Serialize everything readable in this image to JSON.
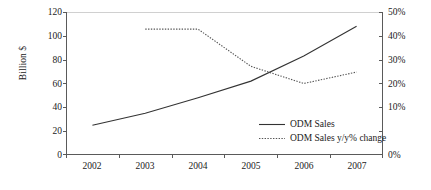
{
  "chart_data": {
    "type": "line",
    "title": "",
    "xlabel": "",
    "categories": [
      "2002",
      "2003",
      "2004",
      "2005",
      "2006",
      "2007"
    ],
    "grid": false,
    "legend_position": "inside-bottom-right",
    "axes": {
      "left": {
        "label": "Billion $",
        "ticks": [
          "0",
          "20",
          "40",
          "60",
          "80",
          "100",
          "120"
        ],
        "values": [
          0,
          20,
          40,
          60,
          80,
          100,
          120
        ],
        "ylim": [
          0,
          120
        ]
      },
      "right": {
        "label": "",
        "ticks": [
          "0%",
          "10%",
          "20%",
          "30%",
          "40%",
          "50%"
        ],
        "values": [
          0,
          10,
          20,
          30,
          40,
          50
        ],
        "ylim": [
          0,
          50
        ]
      }
    },
    "series": [
      {
        "name": "ODM Sales",
        "axis": "left",
        "style": "solid",
        "color": "#333333",
        "values": [
          25,
          35,
          48,
          62,
          83,
          108
        ]
      },
      {
        "name": "ODM Sales y/y% change",
        "axis": "right",
        "style": "dotted",
        "color": "#555555",
        "values": [
          null,
          44,
          44,
          31,
          25,
          29
        ]
      }
    ]
  },
  "legend": {
    "items": [
      {
        "label": "ODM Sales"
      },
      {
        "label": "ODM Sales y/y% change"
      }
    ]
  },
  "axis_titles": {
    "left": "Billion $"
  },
  "y_left_labels": [
    "120",
    "100",
    "80",
    "60",
    "40",
    "20",
    "0"
  ],
  "y_right_labels": [
    "50%",
    "40%",
    "30%",
    "20%",
    "10%",
    "0%"
  ],
  "x_labels": [
    "2002",
    "2003",
    "2004",
    "2005",
    "2006",
    "2007"
  ],
  "colors": {
    "axis": "#5a5a5a",
    "series_solid": "#333333",
    "series_dotted": "#555555",
    "top_rule": "#d0d0d0",
    "background": "#ffffff"
  }
}
